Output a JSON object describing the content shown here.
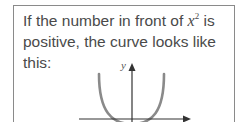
{
  "caption": {
    "line1_prefix": "If the number in front of ",
    "variable": "x",
    "exponent": "2",
    "line1_suffix": " is",
    "line2": "positive, the curve looks like this:"
  },
  "graph": {
    "y_axis_label": "y",
    "curve": "parabola opening upward (positive x² coefficient)",
    "colors": {
      "curve": "#8a8a8a",
      "axes": "#333333",
      "text": "#4a4a4a",
      "border": "#8a8a8a"
    }
  }
}
